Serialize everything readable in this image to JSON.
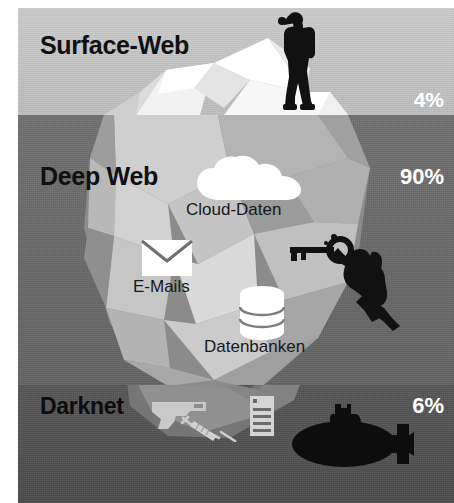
{
  "infographic": {
    "title": "Iceberg model of the web",
    "layers": [
      {
        "id": "surface",
        "label": "Surface-Web",
        "percent": "4%",
        "band_color": "#c8c8c8",
        "label_color": "#101010",
        "percent_color": "#ffffff"
      },
      {
        "id": "deep",
        "label": "Deep Web",
        "percent": "90%",
        "band_color": "#6c6c6c",
        "label_color": "#101010",
        "percent_color": "#ffffff"
      },
      {
        "id": "darknet",
        "label": "Darknet",
        "percent": "6%",
        "band_color": "#515151",
        "label_color": "#0d0d0d",
        "percent_color": "#ffffff"
      }
    ],
    "deep_items": [
      {
        "id": "cloud",
        "label": "Cloud-Daten",
        "icon": "cloud-icon"
      },
      {
        "id": "mail",
        "label": "E-Mails",
        "icon": "envelope-icon"
      },
      {
        "id": "db",
        "label": "Datenbanken",
        "icon": "database-icon"
      }
    ],
    "darknet_icons": [
      {
        "id": "gun",
        "icon": "pistol-icon"
      },
      {
        "id": "syringe",
        "icon": "syringe-icon"
      },
      {
        "id": "doc",
        "icon": "document-list-icon"
      }
    ],
    "figures": [
      {
        "id": "photographer",
        "icon": "person-with-binoculars-icon"
      },
      {
        "id": "diver",
        "icon": "scuba-diver-with-key-icon"
      },
      {
        "id": "submarine",
        "icon": "submarine-icon"
      }
    ],
    "iceberg": {
      "icon": "iceberg-icon",
      "facet_light": "#ffffff",
      "facet_mid": "#d8d8d8",
      "facet_dark": "#9a9a9a"
    }
  }
}
